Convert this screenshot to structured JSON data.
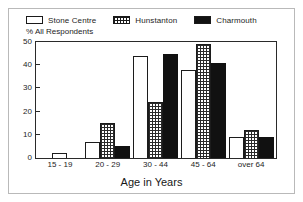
{
  "chart_data": {
    "type": "bar",
    "title": "",
    "xlabel": "Age in Years",
    "ylabel": "% All Respondents",
    "categories": [
      "15 - 19",
      "20 - 29",
      "30 - 44",
      "45 - 64",
      "over 64"
    ],
    "series": [
      {
        "name": "Stone Centre",
        "swatch": "white",
        "color": "#ffffff",
        "values": [
          2,
          7,
          44,
          38,
          9
        ]
      },
      {
        "name": "Hunstanton",
        "swatch": "hatch",
        "color": "#2a2a2a",
        "values": [
          0,
          15,
          24,
          49,
          12
        ]
      },
      {
        "name": "Charmouth",
        "swatch": "black",
        "color": "#111111",
        "values": [
          0,
          5,
          45,
          41,
          9
        ]
      }
    ],
    "ylim": [
      0,
      50
    ],
    "yticks": [
      50,
      40,
      30,
      20,
      10,
      0
    ],
    "grid": false,
    "legend_position": "top-left"
  },
  "legend": {
    "entries": [
      {
        "label": "Stone Centre"
      },
      {
        "label": "Hunstanton"
      },
      {
        "label": "Charmouth"
      }
    ]
  },
  "axes": {
    "y_caption": "% All Respondents",
    "x_title": "Age in Years"
  }
}
